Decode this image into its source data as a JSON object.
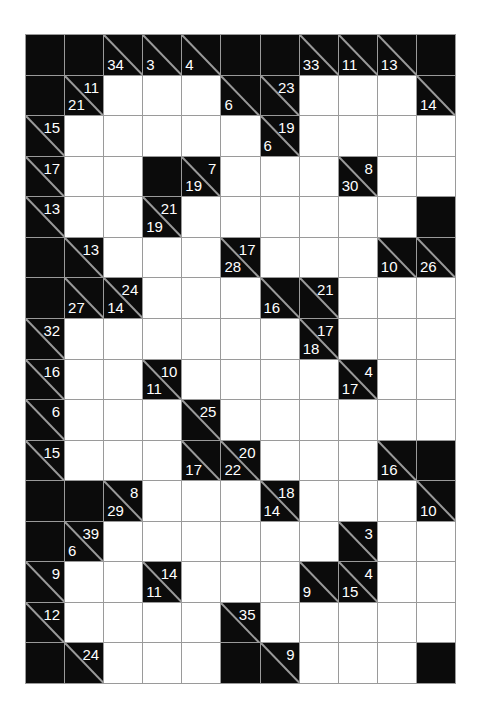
{
  "puzzle": {
    "type": "kakuro",
    "cols": 11,
    "rows": 16,
    "colors": {
      "block": "#0b0b0b",
      "grid_line": "#9a9a9a",
      "white_cell": "#ffffff",
      "clue_text": "#ffffff"
    },
    "legend": "Cell codes: B = plain black block, W = empty white cell, [down,across] = clue cell (null = no clue on that side)",
    "grid": [
      [
        "B",
        "B",
        [
          34,
          null
        ],
        [
          3,
          null
        ],
        [
          4,
          null
        ],
        "B",
        "B",
        [
          33,
          null
        ],
        [
          11,
          null
        ],
        [
          13,
          null
        ],
        "B"
      ],
      [
        "B",
        [
          21,
          11
        ],
        "W",
        "W",
        "W",
        [
          6,
          null
        ],
        [
          null,
          23
        ],
        "W",
        "W",
        "W",
        [
          14,
          null
        ]
      ],
      [
        [
          null,
          15
        ],
        "W",
        "W",
        "W",
        "W",
        "W",
        [
          6,
          19
        ],
        "W",
        "W",
        "W",
        "W"
      ],
      [
        [
          null,
          17
        ],
        "W",
        "W",
        "B",
        [
          19,
          7
        ],
        "W",
        "W",
        "W",
        [
          30,
          8
        ],
        "W",
        "W"
      ],
      [
        [
          null,
          13
        ],
        "W",
        "W",
        [
          19,
          21
        ],
        "W",
        "W",
        "W",
        "W",
        "W",
        "W",
        "B"
      ],
      [
        "B",
        [
          null,
          13
        ],
        "W",
        "W",
        "W",
        [
          28,
          17
        ],
        "W",
        "W",
        "W",
        [
          10,
          null
        ],
        [
          26,
          null
        ]
      ],
      [
        "B",
        [
          27,
          null
        ],
        [
          14,
          24
        ],
        "W",
        "W",
        "W",
        [
          16,
          null
        ],
        [
          null,
          21
        ],
        "W",
        "W",
        "W"
      ],
      [
        [
          null,
          32
        ],
        "W",
        "W",
        "W",
        "W",
        "W",
        "W",
        [
          18,
          17
        ],
        "W",
        "W",
        "W"
      ],
      [
        [
          null,
          16
        ],
        "W",
        "W",
        [
          11,
          10
        ],
        "W",
        "W",
        "W",
        "W",
        [
          17,
          4
        ],
        "W",
        "W"
      ],
      [
        [
          null,
          6
        ],
        "W",
        "W",
        "W",
        [
          null,
          25
        ],
        "W",
        "W",
        "W",
        "W",
        "W",
        "W"
      ],
      [
        [
          null,
          15
        ],
        "W",
        "W",
        "W",
        [
          17,
          null
        ],
        [
          22,
          20
        ],
        "W",
        "W",
        "W",
        [
          16,
          null
        ],
        "B"
      ],
      [
        "B",
        "B",
        [
          29,
          8
        ],
        "W",
        "W",
        "W",
        [
          14,
          18
        ],
        "W",
        "W",
        "W",
        [
          10,
          null
        ]
      ],
      [
        "B",
        [
          6,
          39
        ],
        "W",
        "W",
        "W",
        "W",
        "W",
        "W",
        [
          null,
          3
        ],
        "W",
        "W"
      ],
      [
        [
          null,
          9
        ],
        "W",
        "W",
        [
          11,
          14
        ],
        "W",
        "W",
        "W",
        [
          9,
          null
        ],
        [
          15,
          4
        ],
        "W",
        "W"
      ],
      [
        [
          null,
          12
        ],
        "W",
        "W",
        "W",
        "W",
        [
          null,
          35
        ],
        "W",
        "W",
        "W",
        "W",
        "W"
      ],
      [
        "B",
        [
          null,
          24
        ],
        "W",
        "W",
        "W",
        "B",
        [
          null,
          9
        ],
        "W",
        "W",
        "W",
        "B"
      ]
    ]
  }
}
